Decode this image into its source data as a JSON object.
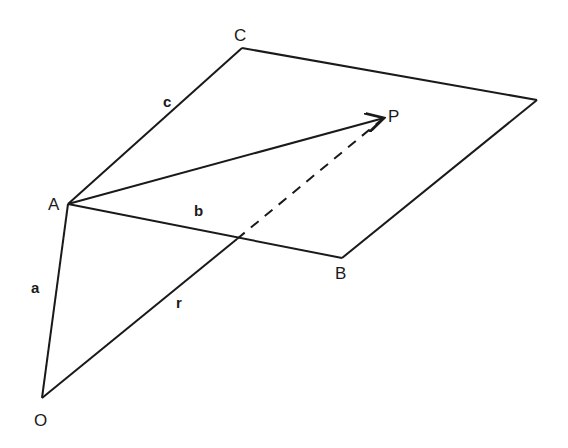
{
  "diagram": {
    "points": {
      "O": {
        "label": "O",
        "x": 42,
        "y": 398
      },
      "A": {
        "label": "A",
        "x": 68,
        "y": 204
      },
      "B": {
        "label": "B",
        "x": 342,
        "y": 258
      },
      "C": {
        "label": "C",
        "x": 242,
        "y": 48
      },
      "D": {
        "label": "",
        "x": 537,
        "y": 100
      },
      "P": {
        "label": "P",
        "x": 384,
        "y": 118
      }
    },
    "vectors": {
      "a": {
        "label": "a",
        "from": "O",
        "to": "A"
      },
      "b": {
        "label": "b",
        "from": "A",
        "to": "B"
      },
      "c": {
        "label": "c",
        "from": "A",
        "to": "C"
      },
      "r": {
        "label": "r",
        "from": "O",
        "to": "P"
      },
      "AP": {
        "label": "",
        "from": "A",
        "to": "P"
      }
    },
    "plane_edges": [
      "A-B",
      "B-D",
      "D-C",
      "C-A"
    ],
    "hidden_segment": "dashed portion of r behind plane",
    "colors": {
      "ink": "#1a1a1a",
      "background": "#ffffff"
    }
  }
}
